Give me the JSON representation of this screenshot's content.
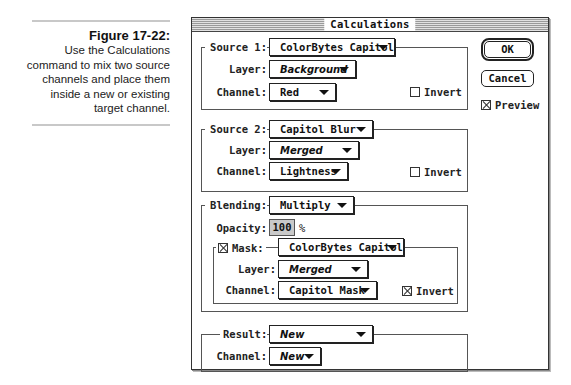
{
  "caption": {
    "title": "Figure 17-22:",
    "text": "Use the Calculations command to mix two source channels and place them inside a new or existing target channel."
  },
  "dialog": {
    "title": "Calculations",
    "buttons": {
      "ok": "OK",
      "cancel": "Cancel"
    },
    "preview": {
      "label": "Preview",
      "checked": true
    },
    "source1": {
      "label": "Source 1:",
      "document": "ColorBytes Capitol",
      "layer_label": "Layer:",
      "layer": "Background",
      "channel_label": "Channel:",
      "channel": "Red",
      "invert_label": "Invert",
      "invert": false
    },
    "source2": {
      "label": "Source 2:",
      "document": "Capitol Blur",
      "layer_label": "Layer:",
      "layer": "Merged",
      "channel_label": "Channel:",
      "channel": "Lightness",
      "invert_label": "Invert",
      "invert": false
    },
    "blending": {
      "label": "Blending:",
      "mode": "Multiply",
      "opacity_label": "Opacity:",
      "opacity": "100",
      "opacity_unit": "%",
      "mask": {
        "label": "Mask:",
        "enabled": true,
        "document": "ColorBytes Capitol",
        "layer_label": "Layer:",
        "layer": "Merged",
        "channel_label": "Channel:",
        "channel": "Capitol Mask",
        "invert_label": "Invert",
        "invert": true
      }
    },
    "result": {
      "label": "Result:",
      "document": "New",
      "channel_label": "Channel:",
      "channel": "New"
    }
  }
}
